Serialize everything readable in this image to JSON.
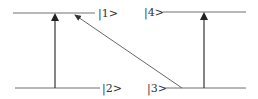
{
  "diagram": {
    "type": "energy-level-diagram",
    "levels": [
      {
        "id": "level-1",
        "label": "|1>"
      },
      {
        "id": "level-2",
        "label": "|2>"
      },
      {
        "id": "level-3",
        "label": "|3>"
      },
      {
        "id": "level-4",
        "label": "|4>"
      }
    ],
    "transitions": [
      {
        "from": "|2>",
        "to": "|1>",
        "style": "vertical-arrow"
      },
      {
        "from": "|3>",
        "to": "|1>",
        "style": "diagonal-arrow"
      },
      {
        "from": "|3>",
        "to": "|4>",
        "style": "vertical-arrow"
      }
    ],
    "colors": {
      "line": "#707070",
      "arrow": "#333333",
      "text": "#333333"
    }
  }
}
